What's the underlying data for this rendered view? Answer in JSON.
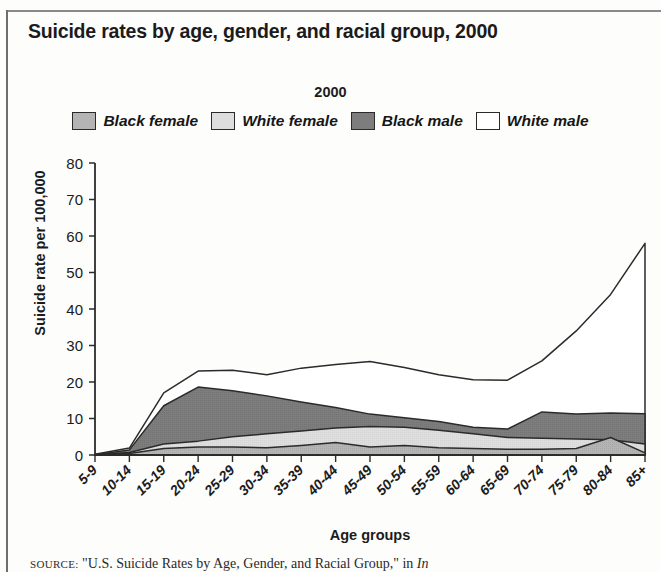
{
  "title": "Suicide rates by age, gender, and racial group, 2000",
  "legend": {
    "heading": "2000",
    "items": [
      {
        "label": "Black female",
        "color": "#b4b4b4"
      },
      {
        "label": "White female",
        "color": "#dedede"
      },
      {
        "label": "Black male",
        "color": "#7d7d7d"
      },
      {
        "label": "White male",
        "color": "#ffffff"
      }
    ]
  },
  "source": {
    "label": "SOURCE:",
    "text": " \"U.S. Suicide Rates by Age, Gender, and Racial Group,\" in ",
    "italic_tail": "In"
  },
  "chart_data": {
    "type": "area",
    "title": "Suicide rates by age, gender, and racial group, 2000",
    "xlabel": "Age groups",
    "ylabel": "Suicide rate per 100,000",
    "ylim": [
      0,
      80
    ],
    "ytick_values": [
      0,
      10,
      20,
      30,
      40,
      50,
      60,
      70,
      80
    ],
    "grid": false,
    "legend_position": "top-center",
    "stacked": false,
    "categories": [
      "5-9",
      "10-14",
      "15-19",
      "20-24",
      "25-29",
      "30-34",
      "35-39",
      "40-44",
      "45-49",
      "50-54",
      "55-59",
      "60-64",
      "65-69",
      "70-74",
      "75-79",
      "80-84",
      "85+"
    ],
    "series": [
      {
        "name": "White male",
        "color": "#ffffff",
        "values": [
          0.2,
          1.9,
          17.0,
          23.0,
          23.2,
          22.0,
          23.8,
          24.8,
          25.6,
          24.0,
          22.0,
          20.6,
          20.5,
          25.8,
          34.0,
          44.0,
          58.0
        ]
      },
      {
        "name": "Black male",
        "color": "#7d7d7d",
        "values": [
          0.1,
          1.4,
          13.5,
          18.6,
          17.6,
          16.2,
          14.5,
          13.0,
          11.2,
          10.2,
          9.2,
          7.6,
          7.1,
          11.8,
          11.2,
          11.5,
          11.3
        ]
      },
      {
        "name": "White female",
        "color": "#dedede",
        "values": [
          0.1,
          0.7,
          3.0,
          3.8,
          5.0,
          5.8,
          6.6,
          7.4,
          7.8,
          7.6,
          6.8,
          5.8,
          4.8,
          4.6,
          4.4,
          4.2,
          3.0
        ]
      },
      {
        "name": "Black female",
        "color": "#b4b4b4",
        "values": [
          0.05,
          0.4,
          1.8,
          2.2,
          2.2,
          2.0,
          2.6,
          3.4,
          2.2,
          2.6,
          2.0,
          1.8,
          1.6,
          1.6,
          1.8,
          4.8,
          0.6
        ]
      }
    ]
  }
}
